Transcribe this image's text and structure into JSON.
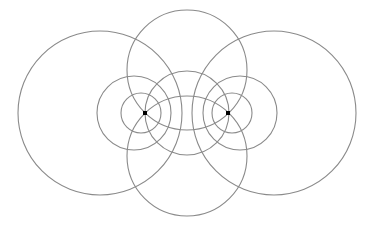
{
  "diagram": {
    "width": 374,
    "height": 228,
    "background": "#ffffff",
    "stroke_color": "#8a8a8a",
    "stroke_width": 1.1,
    "point_color": "#000000",
    "points": [
      {
        "id": "left-focus",
        "x": 145,
        "y": 113
      },
      {
        "id": "right-focus",
        "x": 228,
        "y": 113
      }
    ],
    "circles": [
      {
        "id": "big-left",
        "cx": 100,
        "cy": 113,
        "r": 82
      },
      {
        "id": "big-right",
        "cx": 274,
        "cy": 113,
        "r": 82
      },
      {
        "id": "top",
        "cx": 187,
        "cy": 70,
        "r": 60
      },
      {
        "id": "bottom",
        "cx": 187,
        "cy": 156,
        "r": 60
      },
      {
        "id": "middle",
        "cx": 187,
        "cy": 113,
        "r": 42
      },
      {
        "id": "medium-left",
        "cx": 134,
        "cy": 113,
        "r": 37
      },
      {
        "id": "medium-right",
        "cx": 240,
        "cy": 113,
        "r": 37
      },
      {
        "id": "small-left",
        "cx": 141,
        "cy": 113,
        "r": 20
      },
      {
        "id": "small-right",
        "cx": 232,
        "cy": 113,
        "r": 20
      }
    ]
  }
}
